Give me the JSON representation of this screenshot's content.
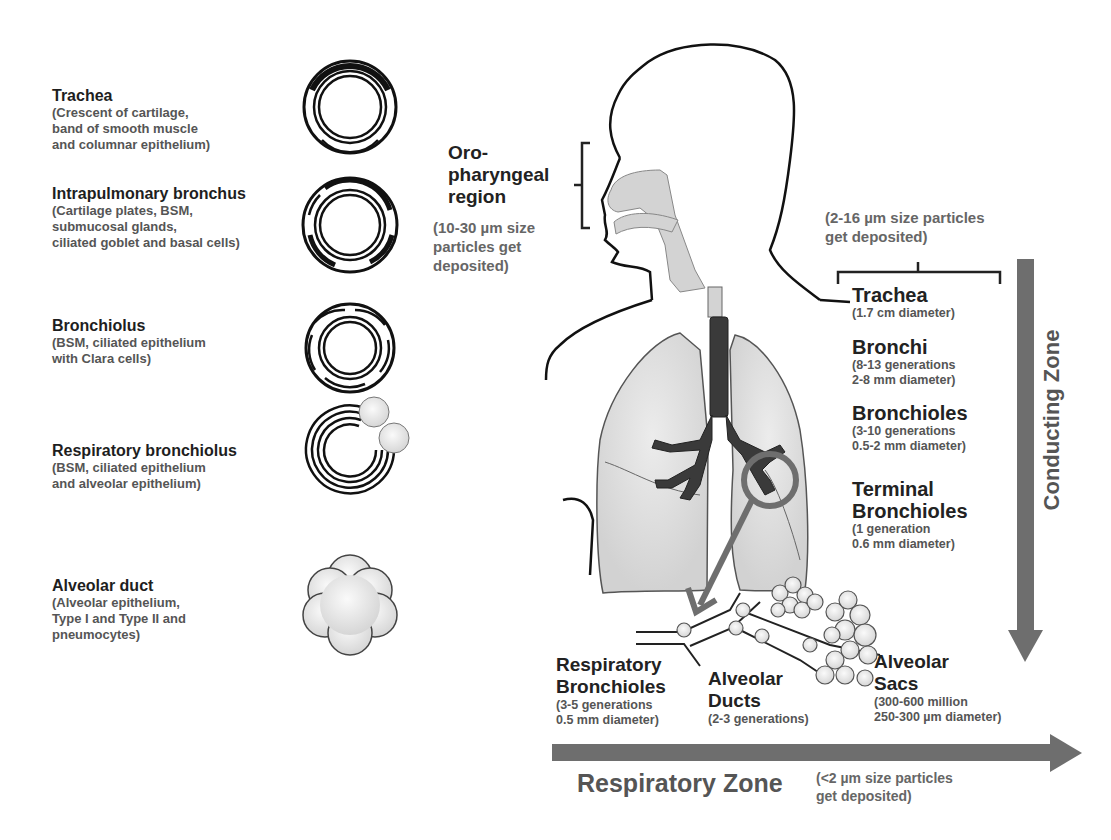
{
  "left_panel": {
    "items": [
      {
        "title": "Trachea",
        "desc": [
          "(Crescent of cartilage,",
          "band of smooth muscle",
          "and columnar epithelium)"
        ]
      },
      {
        "title": "Intrapulmonary bronchus",
        "desc": [
          "(Cartilage plates, BSM,",
          "submucosal glands,",
          "ciliated goblet and basal cells)"
        ]
      },
      {
        "title": "Bronchiolus",
        "desc": [
          "(BSM, ciliated epithelium",
          "with Clara cells)"
        ]
      },
      {
        "title": "Respiratory bronchiolus",
        "desc": [
          "(BSM, ciliated epithelium",
          "and alveolar epithelium)"
        ]
      },
      {
        "title": "Alveolar duct",
        "desc": [
          "(Alveolar epithelium,",
          "Type I and Type II and",
          "pneumocytes)"
        ]
      }
    ]
  },
  "oropharyngeal": {
    "title": [
      "Oro-",
      "pharyngeal",
      "region"
    ],
    "note": [
      "(10-30 µm size",
      "particles get",
      "deposited)"
    ]
  },
  "conducting": {
    "note": [
      "(2-16 µm size particles",
      "get deposited)"
    ],
    "zone_label": "Conducting Zone",
    "items": [
      {
        "title": [
          "Trachea"
        ],
        "desc": [
          "(1.7 cm diameter)"
        ]
      },
      {
        "title": [
          "Bronchi"
        ],
        "desc": [
          "(8-13 generations",
          "2-8 mm diameter)"
        ]
      },
      {
        "title": [
          "Bronchioles"
        ],
        "desc": [
          "(3-10 generations",
          "0.5-2 mm diameter)"
        ]
      },
      {
        "title": [
          "Terminal",
          "Bronchioles"
        ],
        "desc": [
          "(1 generation",
          "0.6 mm diameter)"
        ]
      }
    ]
  },
  "respiratory": {
    "zone_label": "Respiratory Zone",
    "note": [
      "(<2 µm size particles",
      "get deposited)"
    ],
    "items": [
      {
        "title": [
          "Respiratory",
          "Bronchioles"
        ],
        "desc": [
          "(3-5 generations",
          "0.5 mm diameter)"
        ]
      },
      {
        "title": [
          "Alveolar",
          "Ducts"
        ],
        "desc": [
          "(2-3 generations)"
        ]
      },
      {
        "title": [
          "Alveolar",
          "Sacs"
        ],
        "desc": [
          "(300-600 million",
          "250-300 µm diameter)"
        ]
      }
    ]
  },
  "colors": {
    "arrow": "#6e6e6e",
    "lung_fill": "#d9d9d9",
    "bronchi": "#3a3a3a",
    "outline": "#111111"
  }
}
